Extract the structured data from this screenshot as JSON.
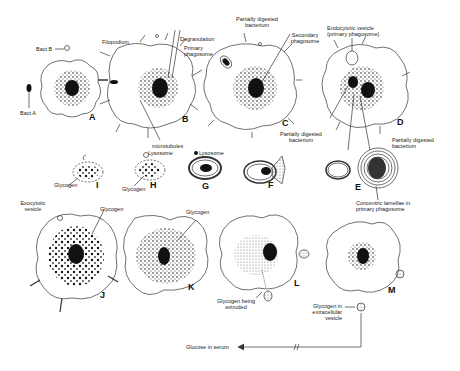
{
  "panels": {
    "A": "A",
    "B": "B",
    "C": "C",
    "D": "D",
    "E": "E",
    "F": "F",
    "G": "G",
    "H": "H",
    "I": "I",
    "J": "J",
    "K": "K",
    "L": "L",
    "M": "M"
  },
  "labels": {
    "bact_a": "Bact A",
    "bact_b": "Bact B",
    "filopodium": "Filopodium",
    "degranulation": "Degranulation",
    "primary_phagosome": "Primary phagosome",
    "microtubules": "microtubules",
    "partially_digested_c_top": "Partially digested bacterium",
    "secondary_phagosome": "Secondary phagosome",
    "endocytotic_vesicle": "Endocytotic vesicle (primary phagosome)",
    "partially_digested_d": "Partially digested bacterium",
    "partially_digested_e": "Partially digested bacterium",
    "concentric_lamellae": "Concentric lamellae in primary phagosome",
    "lysosome_h": "Lysosome",
    "lysosome_g": "Lysosome",
    "glycogen_i": "Glycogen",
    "glycogen_h": "Glycogen",
    "exocytotic_vesicle": "Exocytotic vesicle",
    "glycogen_j": "Glycogen",
    "glycogen_k": "Glycogen",
    "glycogen_extruded": "Glycogen being extruded",
    "glycogen_extracellular": "Glycogen in extracellular vesicle",
    "glucose_serum": "Glucose in serum"
  }
}
